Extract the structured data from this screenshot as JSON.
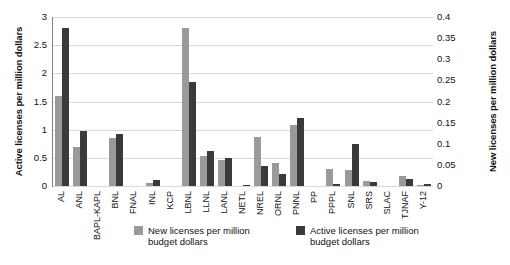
{
  "chart_data": {
    "type": "bar",
    "title": "",
    "xlabel": "",
    "grid": true,
    "legend_position": "bottom",
    "categories": [
      "AL",
      "ANL",
      "BAPL-KAPL",
      "BNL",
      "FNAL",
      "INL",
      "KCP",
      "LBNL",
      "LLNL",
      "LANL",
      "NETL",
      "NREL",
      "ORNL",
      "PNNL",
      "PP",
      "PPPL",
      "SNL",
      "SRS",
      "SLAC",
      "TJNAF",
      "Y-12"
    ],
    "series": [
      {
        "name": "New licenses per million budget dollars",
        "axis": "right",
        "color": "#9a9a9a",
        "values_left_scale": [
          1.6,
          0.69,
          0.0,
          0.86,
          0.0,
          0.06,
          0.0,
          2.8,
          0.53,
          0.47,
          0.0,
          0.87,
          0.41,
          1.08,
          0.0,
          0.31,
          0.29,
          0.09,
          0.0,
          0.17,
          0.02
        ],
        "values": [
          0.2133,
          0.092,
          0.0,
          0.1147,
          0.0,
          0.008,
          0.0,
          0.3733,
          0.0707,
          0.0627,
          0.0,
          0.116,
          0.0547,
          0.144,
          0.0,
          0.0413,
          0.0387,
          0.012,
          0.0,
          0.0227,
          0.0027
        ]
      },
      {
        "name": "Active licenses per million budget dollars",
        "axis": "left",
        "color": "#3a3a3a",
        "values": [
          2.8,
          0.97,
          0.0,
          0.92,
          0.0,
          0.11,
          0.0,
          1.85,
          0.63,
          0.5,
          0.02,
          0.36,
          0.21,
          1.2,
          0.0,
          0.04,
          0.74,
          0.08,
          0.0,
          0.13,
          0.03
        ]
      }
    ],
    "y_left": {
      "label": "Active licenses per million dollars",
      "ticks": [
        "0",
        "0.5",
        "1",
        "1.5",
        "2",
        "2.5",
        "3"
      ],
      "tick_values": [
        0,
        0.5,
        1,
        1.5,
        2,
        2.5,
        3
      ],
      "ylim": [
        0,
        3
      ]
    },
    "y_right": {
      "label": "New licenses per million dollars",
      "ticks": [
        "0",
        "0.05",
        "0.1",
        "0.15",
        "0.2",
        "0.25",
        "0.3",
        "0.35",
        "0.4"
      ],
      "tick_values": [
        0,
        0.05,
        0.1,
        0.15,
        0.2,
        0.25,
        0.3,
        0.35,
        0.4
      ],
      "ylim": [
        0,
        0.4
      ]
    },
    "legend": [
      {
        "label": "New licenses per million budget dollars",
        "color": "#9a9a9a"
      },
      {
        "label": "Active licenses per million budget dollars",
        "color": "#3a3a3a"
      }
    ]
  }
}
